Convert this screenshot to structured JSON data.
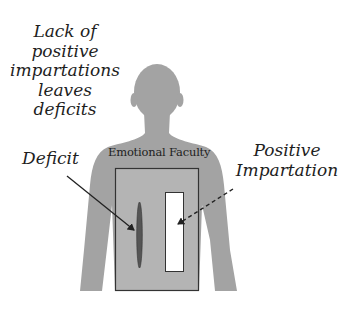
{
  "diagram": {
    "title_lines": [
      "Lack of",
      "positive",
      "impartations",
      "leaves",
      "deficits"
    ],
    "labels": {
      "deficit": "Deficit",
      "emotional_faculty": "Emotional Faculty",
      "positive_impartation_lines": [
        "Positive",
        "Impartation"
      ]
    },
    "colors": {
      "background": "#ffffff",
      "silhouette": "#a3a3a3",
      "faculty_box_fill": "#b4b4b4",
      "faculty_box_stroke": "#333333",
      "impartation_fill": "#ffffff",
      "deficit_fill": "#555555",
      "text": "#1e1e1e"
    },
    "icons": {
      "silhouette": "human-silhouette-icon",
      "deficit_arrow": "solid-arrow",
      "impartation_arrow": "dashed-arrow"
    }
  }
}
